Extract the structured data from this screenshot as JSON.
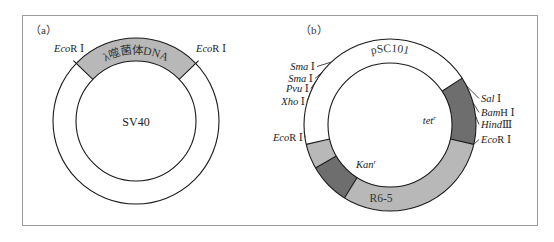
{
  "panels": [
    {
      "id": "a",
      "label": "（a）",
      "plasmid_name": "SV40",
      "insert_label": "λ噬菌体DNA",
      "colors": {
        "insert": "#b8b8b8",
        "ring": "#ffffff"
      },
      "sites": [
        {
          "enzyme": "Eco",
          "suffix": "R Ⅰ",
          "side": "left"
        },
        {
          "enzyme": "Eco",
          "suffix": "R Ⅰ",
          "side": "right"
        }
      ]
    },
    {
      "id": "b",
      "label": "（b）",
      "plasmid_name": "pSC101",
      "segment_labels": {
        "tet": "tet",
        "tet_sup": "r",
        "kan": "Kan",
        "kan_sup": "r",
        "r65": "R6-5"
      },
      "colors": {
        "tet": "#6e6e6e",
        "kan": "#6e6e6e",
        "r65": "#b8b8b8",
        "pSC101": "#ffffff"
      },
      "left_sites": [
        {
          "enzyme": "Sma",
          "suffix": " Ⅰ"
        },
        {
          "enzyme": "Sma",
          "suffix": " Ⅰ"
        },
        {
          "enzyme": "Pvu",
          "suffix": " Ⅰ"
        },
        {
          "enzyme": "Xho",
          "suffix": " Ⅰ"
        },
        {
          "enzyme": "Eco",
          "suffix": "R Ⅰ"
        }
      ],
      "right_sites": [
        {
          "enzyme": "Sal",
          "suffix": " Ⅰ"
        },
        {
          "enzyme": "Bam",
          "suffix": "H Ⅰ"
        },
        {
          "enzyme": "Hind",
          "suffix": "Ⅲ"
        },
        {
          "enzyme": "Eco",
          "suffix": "R Ⅰ"
        }
      ]
    }
  ]
}
